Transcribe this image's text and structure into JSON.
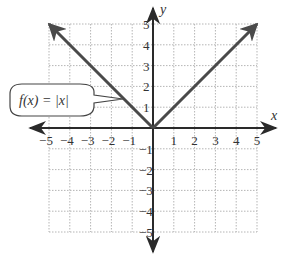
{
  "chart_data": {
    "type": "line",
    "title": "",
    "function_label": "f(x) = |x|",
    "xlabel": "x",
    "ylabel": "y",
    "xlim": [
      -5,
      5
    ],
    "ylim": [
      -5,
      5
    ],
    "grid": true,
    "x_ticks": [
      "-5",
      "-4",
      "-3",
      "-2",
      "-1",
      "1",
      "2",
      "3",
      "4",
      "5"
    ],
    "y_ticks": [
      "5",
      "4",
      "3",
      "2",
      "1",
      "-1",
      "-2",
      "-3",
      "-4",
      "-5"
    ],
    "series": [
      {
        "name": "f(x) = |x|",
        "x": [
          -5,
          -4,
          -3,
          -2,
          -1,
          0,
          1,
          2,
          3,
          4,
          5
        ],
        "y": [
          5,
          4,
          3,
          2,
          1,
          0,
          1,
          2,
          3,
          4,
          5
        ]
      }
    ],
    "colors": {
      "line": "#4a4a4a",
      "axes": "#333333",
      "grid": "#b5b5b5"
    }
  }
}
